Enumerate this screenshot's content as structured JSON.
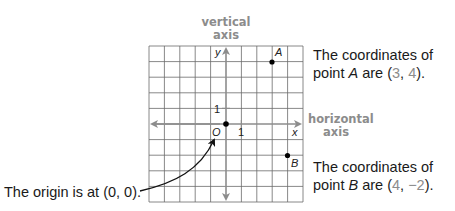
{
  "labels": {
    "vertical_axis_line1": "vertical",
    "vertical_axis_line2": "axis",
    "horizontal_axis_line1": "horizontal",
    "horizontal_axis_line2": "axis",
    "y_axis": "y",
    "x_axis": "x",
    "origin": "O",
    "tick_y": "1",
    "tick_x": "1",
    "point_a": "A",
    "point_b": "B"
  },
  "captions": {
    "a": {
      "line1": "The coordinates of",
      "prefix": "point ",
      "point": "A",
      "middle": " are (",
      "x": "3",
      "sep": ", ",
      "y": "4",
      "suffix": ")."
    },
    "b": {
      "line1": "The coordinates of",
      "prefix": "point ",
      "point": "B",
      "middle": " are (",
      "x": "4",
      "sep": ", ",
      "y": "−2",
      "suffix": ")."
    },
    "origin": "The origin is at (0, 0)."
  },
  "colors": {
    "axis_label": "#8c8c8c",
    "grid": "#555555",
    "axis": "#8c8c8c",
    "point": "#000000"
  },
  "grid": {
    "x_range": [
      -5,
      5
    ],
    "y_range": [
      -5,
      5
    ],
    "unit": 1
  },
  "points": [
    {
      "name": "A",
      "x": 3,
      "y": 4
    },
    {
      "name": "B",
      "x": 4,
      "y": -2
    },
    {
      "name": "O",
      "x": 0,
      "y": 0
    }
  ]
}
